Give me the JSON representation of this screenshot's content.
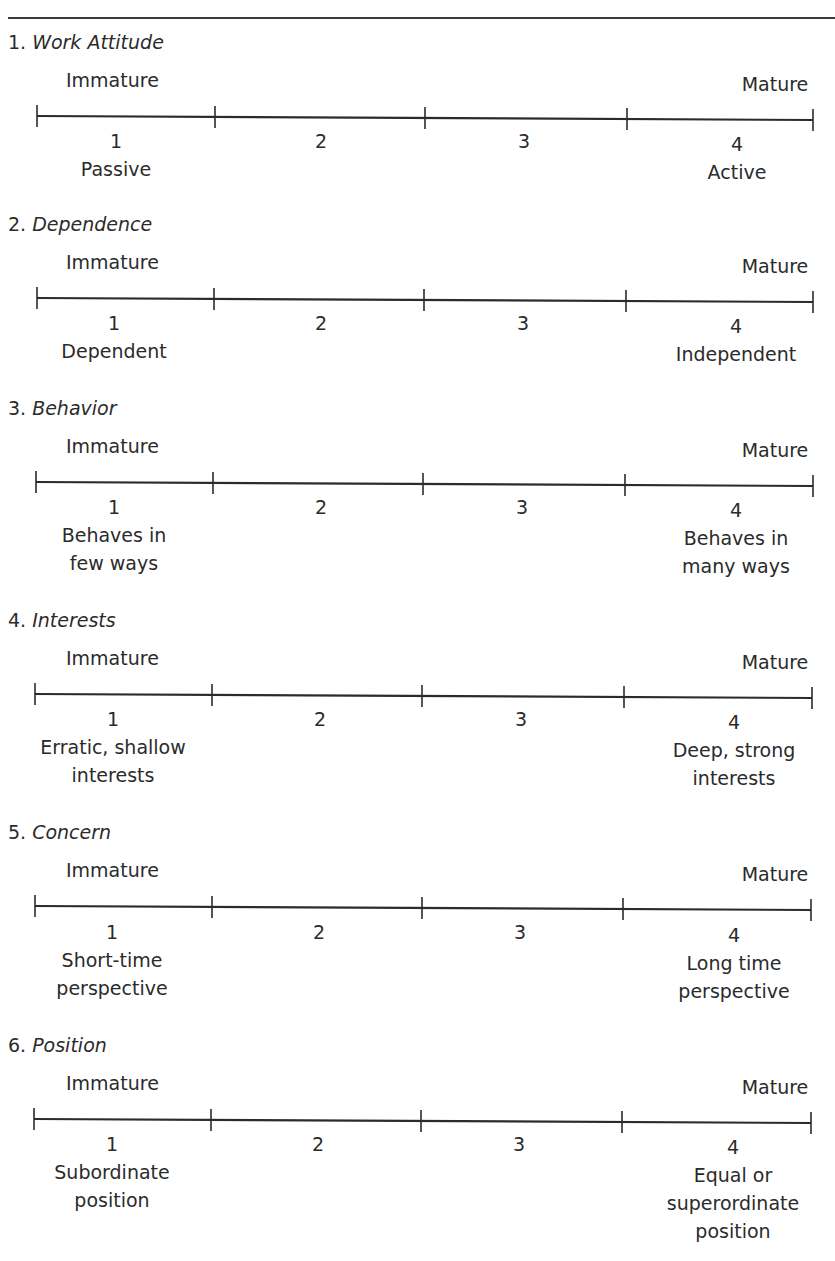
{
  "document": {
    "title_partial": "",
    "scales": [
      {
        "number": "1.",
        "name": "Work Attitude",
        "left_anchor": "Immature",
        "right_anchor": "Mature",
        "points": [
          {
            "value": "1",
            "desc": "Passive"
          },
          {
            "value": "2",
            "desc": ""
          },
          {
            "value": "3",
            "desc": ""
          },
          {
            "value": "4",
            "desc": "Active"
          }
        ]
      },
      {
        "number": "2.",
        "name": "Dependence",
        "left_anchor": "Immature",
        "right_anchor": "Mature",
        "points": [
          {
            "value": "1",
            "desc": "Dependent"
          },
          {
            "value": "2",
            "desc": ""
          },
          {
            "value": "3",
            "desc": ""
          },
          {
            "value": "4",
            "desc": "Independent"
          }
        ]
      },
      {
        "number": "3.",
        "name": "Behavior",
        "left_anchor": "Immature",
        "right_anchor": "Mature",
        "points": [
          {
            "value": "1",
            "desc_line1": "Behaves in",
            "desc_line2": "few ways"
          },
          {
            "value": "2"
          },
          {
            "value": "3"
          },
          {
            "value": "4",
            "desc_line1": "Behaves in",
            "desc_line2": "many ways"
          }
        ]
      },
      {
        "number": "4.",
        "name": "Interests",
        "left_anchor": "Immature",
        "right_anchor": "Mature",
        "points": [
          {
            "value": "1",
            "desc_line1": "Erratic, shallow",
            "desc_line2": "interests"
          },
          {
            "value": "2"
          },
          {
            "value": "3"
          },
          {
            "value": "4",
            "desc_line1": "Deep, strong",
            "desc_line2": "interests"
          }
        ]
      },
      {
        "number": "5.",
        "name": "Concern",
        "left_anchor": "Immature",
        "right_anchor": "Mature",
        "points": [
          {
            "value": "1",
            "desc_line1": "Short-time",
            "desc_line2": "perspective"
          },
          {
            "value": "2"
          },
          {
            "value": "3"
          },
          {
            "value": "4",
            "desc_line1": "Long time",
            "desc_line2": "perspective"
          }
        ]
      },
      {
        "number": "6.",
        "name": "Position",
        "left_anchor": "Immature",
        "right_anchor": "Mature",
        "points": [
          {
            "value": "1",
            "desc_line1": "Subordinate",
            "desc_line2": "position"
          },
          {
            "value": "2"
          },
          {
            "value": "3"
          },
          {
            "value": "4",
            "desc_line1": "Equal or",
            "desc_line2": "superordinate",
            "desc_line3": "position"
          }
        ]
      }
    ]
  },
  "colors": {
    "text": "#2b2b2b",
    "rule": "#3a3a3a",
    "background": "#ffffff"
  }
}
